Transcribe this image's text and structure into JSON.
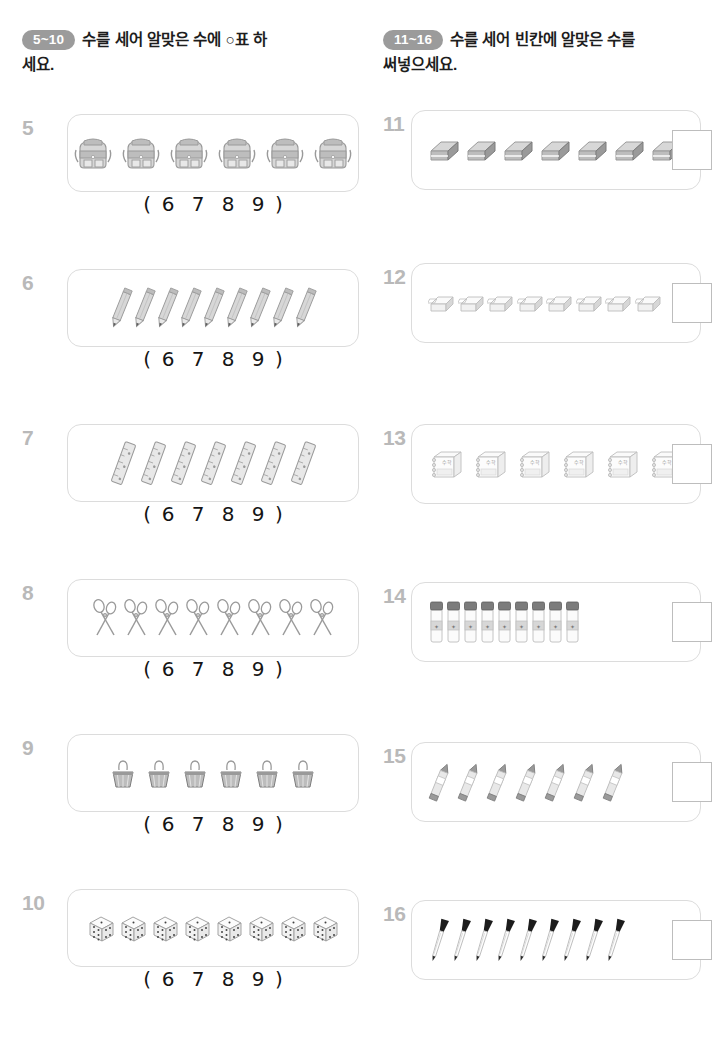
{
  "page": {
    "width": 722,
    "height": 1055,
    "background": "#ffffff",
    "text_color": "#1d1d1d",
    "number_color": "#b9b9b9",
    "frame_border_color": "#dcdcdc",
    "badge_color": "#9b9b9b"
  },
  "sections": [
    {
      "id": "left",
      "badge": "5~10",
      "instruction_line1": "수를 세어 알맞은 수에 ○표 하",
      "instruction_line2": "세요.",
      "answer_mode": "circle-choice"
    },
    {
      "id": "right",
      "badge": "11~16",
      "instruction_line1": "수를 세어 빈칸에 알맞은 수를",
      "instruction_line2": "써넣으세요.",
      "answer_mode": "write-in-box"
    }
  ],
  "choice_options": [
    "6",
    "7",
    "8",
    "9"
  ],
  "choice_open_paren": "(",
  "choice_close_paren": ")",
  "problems_left": [
    {
      "number": "5",
      "object": "backpack",
      "object_label": "backpack-icon",
      "count": 6,
      "answer": "6"
    },
    {
      "number": "6",
      "object": "pencil",
      "object_label": "pencil-icon",
      "count": 9,
      "answer": "9"
    },
    {
      "number": "7",
      "object": "ruler",
      "object_label": "ruler-icon",
      "count": 7,
      "answer": "7"
    },
    {
      "number": "8",
      "object": "scissors",
      "object_label": "scissors-icon",
      "count": 8,
      "answer": "8"
    },
    {
      "number": "9",
      "object": "binder-clip",
      "object_label": "binder-clip-icon",
      "count": 6,
      "answer": "6"
    },
    {
      "number": "10",
      "object": "dice",
      "object_label": "dice-icon",
      "count": 8,
      "answer": "8"
    }
  ],
  "problems_right": [
    {
      "number": "11",
      "object": "eraser",
      "object_label": "eraser-icon",
      "count": 7,
      "answer": ""
    },
    {
      "number": "12",
      "object": "eraser-small",
      "object_label": "small-eraser-icon",
      "count": 8,
      "answer": ""
    },
    {
      "number": "13",
      "object": "notebook",
      "object_label": "notebook-icon",
      "count": 6,
      "answer": ""
    },
    {
      "number": "14",
      "object": "glue-stick",
      "object_label": "glue-stick-icon",
      "count": 9,
      "answer": ""
    },
    {
      "number": "15",
      "object": "crayon",
      "object_label": "crayon-icon",
      "count": 7,
      "answer": ""
    },
    {
      "number": "16",
      "object": "pen",
      "object_label": "pen-icon",
      "count": 9,
      "answer": ""
    }
  ]
}
